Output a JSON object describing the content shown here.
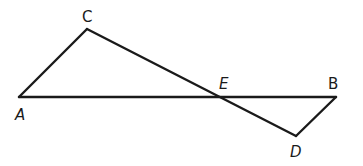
{
  "diagram": {
    "type": "geometry-figure",
    "points": {
      "A": {
        "x": 19,
        "y": 97
      },
      "C": {
        "x": 87,
        "y": 29
      },
      "E": {
        "x": 216,
        "y": 97
      },
      "B": {
        "x": 336,
        "y": 97
      },
      "D": {
        "x": 296,
        "y": 136
      }
    },
    "segments": [
      {
        "from": "A",
        "to": "C"
      },
      {
        "from": "C",
        "to": "D"
      },
      {
        "from": "A",
        "to": "B"
      },
      {
        "from": "B",
        "to": "D"
      }
    ],
    "labels": [
      {
        "text": "C",
        "x": 82,
        "y": 22,
        "italic": false
      },
      {
        "text": "A",
        "x": 15,
        "y": 120,
        "italic": true
      },
      {
        "text": "E",
        "x": 219,
        "y": 89,
        "italic": true
      },
      {
        "text": "B",
        "x": 328,
        "y": 89,
        "italic": false
      },
      {
        "text": "D",
        "x": 290,
        "y": 157,
        "italic": true
      }
    ],
    "stroke_color": "#1a1a1a",
    "background_color": "#ffffff"
  }
}
